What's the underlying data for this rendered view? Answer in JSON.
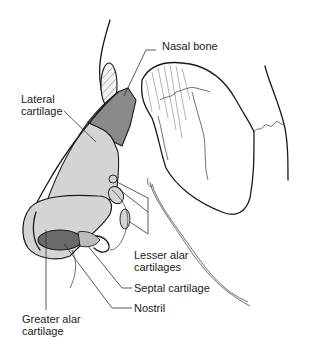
{
  "diagram": {
    "colors": {
      "nasal_bone": "#8a8a8a",
      "cartilage": "#d4d4d4",
      "outline": "#1a1a1a",
      "background": "#ffffff"
    },
    "labels": {
      "nasal_bone": "Nasal bone",
      "lateral_cartilage_line1": "Lateral",
      "lateral_cartilage_line2": "cartilage",
      "lesser_alar_line1": "Lesser alar",
      "lesser_alar_line2": "cartilages",
      "septal_cartilage": "Septal cartilage",
      "nostril": "Nostril",
      "greater_alar_line1": "Greater alar",
      "greater_alar_line2": "cartilage"
    }
  }
}
